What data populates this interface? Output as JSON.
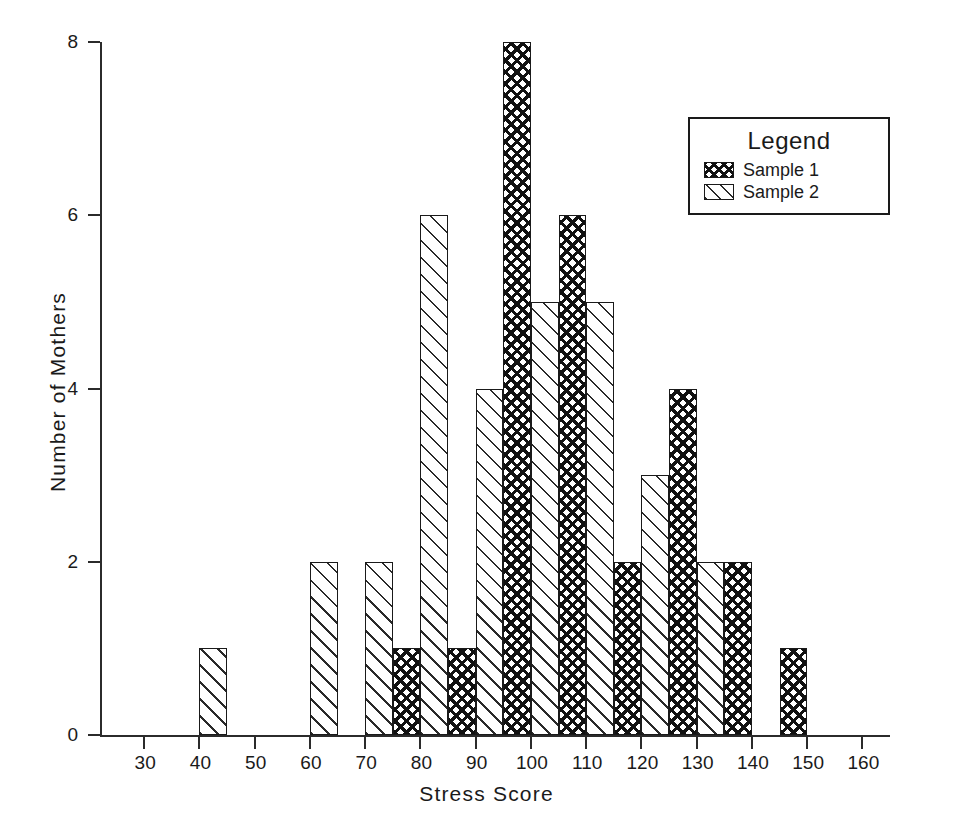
{
  "chart_data": {
    "type": "bar",
    "title": "",
    "subtitle": "",
    "xlabel": "Stress Score",
    "ylabel": "Number of Mothers",
    "xlim": [
      22,
      165
    ],
    "ylim": [
      0,
      8
    ],
    "xticks": [
      30,
      40,
      50,
      60,
      70,
      80,
      90,
      100,
      110,
      120,
      130,
      140,
      150,
      160
    ],
    "yticks": [
      0,
      2,
      4,
      6,
      8
    ],
    "xtick_labels": [
      "30",
      "40",
      "50",
      "60",
      "70",
      "80",
      "90",
      "100",
      "110",
      "120",
      "130",
      "140",
      "150",
      "160"
    ],
    "ytick_labels": [
      "0",
      "2",
      "4",
      "6",
      "8"
    ],
    "grid": false,
    "bin_width": 5,
    "legend": {
      "title": "Legend",
      "position": "top-right",
      "entries": [
        {
          "name": "Sample 1",
          "pattern": "crosshatch"
        },
        {
          "name": "Sample 2",
          "pattern": "diagonal-hatch"
        }
      ]
    },
    "series": [
      {
        "name": "Sample 1",
        "pattern": "crosshatch",
        "bins": [
          {
            "start": 75,
            "end": 80,
            "value": 1
          },
          {
            "start": 85,
            "end": 90,
            "value": 1
          },
          {
            "start": 95,
            "end": 100,
            "value": 8
          },
          {
            "start": 105,
            "end": 110,
            "value": 6
          },
          {
            "start": 115,
            "end": 120,
            "value": 2
          },
          {
            "start": 125,
            "end": 130,
            "value": 4
          },
          {
            "start": 135,
            "end": 140,
            "value": 2
          },
          {
            "start": 145,
            "end": 150,
            "value": 1
          }
        ]
      },
      {
        "name": "Sample 2",
        "pattern": "diagonal-hatch",
        "bins": [
          {
            "start": 40,
            "end": 45,
            "value": 1
          },
          {
            "start": 60,
            "end": 65,
            "value": 2
          },
          {
            "start": 70,
            "end": 75,
            "value": 2
          },
          {
            "start": 80,
            "end": 85,
            "value": 6
          },
          {
            "start": 90,
            "end": 95,
            "value": 4
          },
          {
            "start": 100,
            "end": 105,
            "value": 5
          },
          {
            "start": 110,
            "end": 115,
            "value": 5
          },
          {
            "start": 120,
            "end": 125,
            "value": 3
          },
          {
            "start": 130,
            "end": 135,
            "value": 2
          }
        ]
      }
    ]
  }
}
